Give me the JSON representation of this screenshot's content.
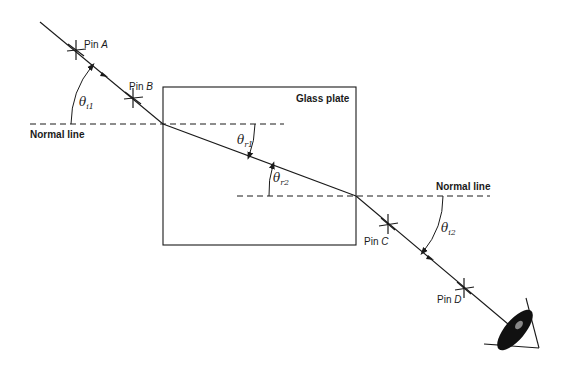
{
  "diagram": {
    "glass_plate": {
      "label": "Glass plate"
    },
    "normal_lines": [
      {
        "label": "Normal line"
      },
      {
        "label": "Normal line"
      }
    ],
    "pins": [
      {
        "prefix": "Pin ",
        "letter": "A"
      },
      {
        "prefix": "Pin ",
        "letter": "B"
      },
      {
        "prefix": "Pin ",
        "letter": "C"
      },
      {
        "prefix": "Pin ",
        "letter": "D"
      }
    ],
    "angles": [
      {
        "symbol": "θ",
        "sub": "i1"
      },
      {
        "symbol": "θ",
        "sub": "r1"
      },
      {
        "symbol": "θ",
        "sub": "r2"
      },
      {
        "symbol": "θ",
        "sub": "i2"
      }
    ],
    "observer": {
      "icon": "eye-icon"
    },
    "colors": {
      "line": "#1a1a1a",
      "background": "#ffffff"
    }
  }
}
